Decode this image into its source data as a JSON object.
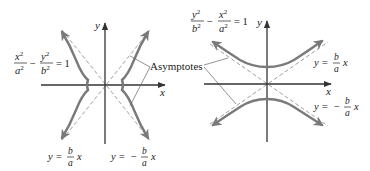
{
  "figure": {
    "left_graph": {
      "equation": {
        "num1": "x",
        "den1": "a",
        "num2": "y",
        "den2": "b",
        "exp": "2",
        "op": "−",
        "rhs": "= 1"
      },
      "axis_labels": {
        "x": "x",
        "y": "y"
      },
      "asymptote_labels": [
        {
          "lhs": "y =",
          "sign": "",
          "num": "b",
          "den": "a",
          "var": "x"
        },
        {
          "lhs": "y =",
          "sign": "−",
          "num": "b",
          "den": "a",
          "var": "x"
        }
      ],
      "orientation": "horizontal-transverse-axis"
    },
    "right_graph": {
      "equation": {
        "num1": "y",
        "den1": "b",
        "num2": "x",
        "den2": "a",
        "exp": "2",
        "op": "−",
        "rhs": "= 1"
      },
      "axis_labels": {
        "x": "x",
        "y": "y"
      },
      "asymptote_labels": [
        {
          "lhs": "y =",
          "sign": "",
          "num": "b",
          "den": "a",
          "var": "x"
        },
        {
          "lhs": "y =",
          "sign": "−",
          "num": "b",
          "den": "a",
          "var": "x"
        }
      ],
      "orientation": "vertical-transverse-axis"
    },
    "shared_callout": "Asymptotes",
    "colors": {
      "curve": "#7a7a7a",
      "axis": "#333333",
      "asymptote": "#777777",
      "text": "#222222"
    }
  }
}
